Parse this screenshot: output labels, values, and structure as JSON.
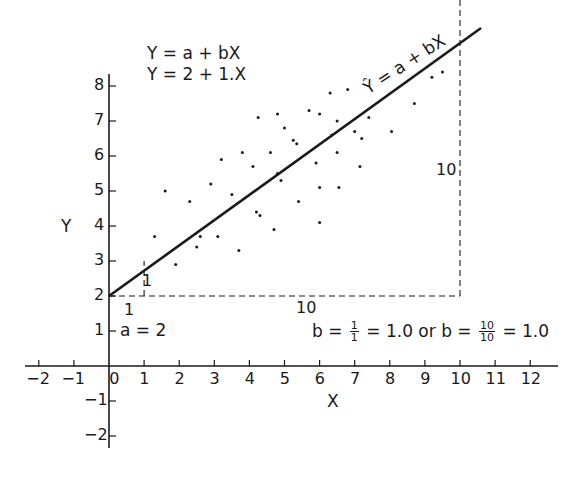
{
  "chart_data": {
    "type": "scatter",
    "title": "",
    "xlabel": "X",
    "ylabel": "Y",
    "xlim": [
      -2.5,
      12.8
    ],
    "ylim": [
      -2.2,
      8.5
    ],
    "grid": false,
    "x_ticks": [
      -2,
      -1,
      0,
      1,
      2,
      3,
      4,
      5,
      6,
      7,
      8,
      9,
      10,
      11,
      12
    ],
    "x_tick_labels": [
      "-2",
      "-1",
      "0",
      "1",
      "2",
      "3",
      "4",
      "5",
      "6",
      "7",
      "8",
      "9",
      "10",
      "11",
      "12"
    ],
    "y_ticks": [
      -2,
      -1,
      1,
      2,
      3,
      4,
      5,
      6,
      7,
      8
    ],
    "y_tick_labels": [
      "-2",
      "-1",
      "1",
      "2",
      "3",
      "4",
      "5",
      "6",
      "7",
      "8"
    ],
    "series": [
      {
        "name": "observations",
        "type": "scatter",
        "points": [
          [
            1.3,
            3.7
          ],
          [
            1.6,
            5.0
          ],
          [
            1.9,
            2.9
          ],
          [
            2.3,
            4.7
          ],
          [
            2.5,
            3.4
          ],
          [
            2.6,
            3.7
          ],
          [
            2.9,
            5.2
          ],
          [
            3.1,
            3.7
          ],
          [
            3.2,
            5.9
          ],
          [
            3.5,
            4.9
          ],
          [
            3.7,
            3.3
          ],
          [
            3.8,
            6.1
          ],
          [
            4.1,
            5.7
          ],
          [
            4.2,
            4.4
          ],
          [
            4.3,
            4.3
          ],
          [
            4.25,
            7.1
          ],
          [
            4.6,
            6.1
          ],
          [
            4.7,
            3.9
          ],
          [
            4.8,
            7.2
          ],
          [
            4.8,
            5.5
          ],
          [
            4.9,
            5.3
          ],
          [
            5.0,
            6.8
          ],
          [
            5.25,
            6.45
          ],
          [
            5.35,
            6.35
          ],
          [
            5.4,
            4.7
          ],
          [
            5.7,
            7.3
          ],
          [
            5.9,
            5.8
          ],
          [
            6.0,
            7.2
          ],
          [
            6.0,
            5.1
          ],
          [
            6.0,
            4.1
          ],
          [
            6.3,
            7.8
          ],
          [
            6.35,
            6.6
          ],
          [
            6.5,
            7.0
          ],
          [
            6.5,
            6.1
          ],
          [
            6.55,
            5.1
          ],
          [
            6.8,
            7.9
          ],
          [
            7.0,
            6.7
          ],
          [
            7.15,
            5.7
          ],
          [
            7.2,
            6.5
          ],
          [
            7.4,
            7.1
          ],
          [
            8.05,
            6.7
          ],
          [
            8.7,
            7.5
          ],
          [
            9.2,
            8.25
          ],
          [
            9.5,
            8.4
          ]
        ]
      },
      {
        "name": "Ŷ = a + bX",
        "type": "line",
        "intercept": 2,
        "slope": 1,
        "x": [
          0,
          10.6
        ],
        "y": [
          2,
          12.6
        ]
      }
    ],
    "annotations": {
      "equation_general": "Y = a + bX",
      "equation_specific": "Y = 2 + 1.X",
      "line_label": "Ŷ = a + bX",
      "intercept_label": "a = 2",
      "small_triangle_run": "1",
      "small_triangle_rise": "1",
      "large_triangle_run": "10",
      "large_triangle_rise": "10",
      "slope_text": {
        "prefix": "b =",
        "frac1_num": "1",
        "frac1_den": "1",
        "middle": "= 1.0 or b =",
        "frac2_num": "10",
        "frac2_den": "10",
        "suffix": "= 1.0"
      }
    },
    "legend": null
  },
  "style": {
    "ink": "#1a1a1a",
    "background": "#ffffff"
  }
}
